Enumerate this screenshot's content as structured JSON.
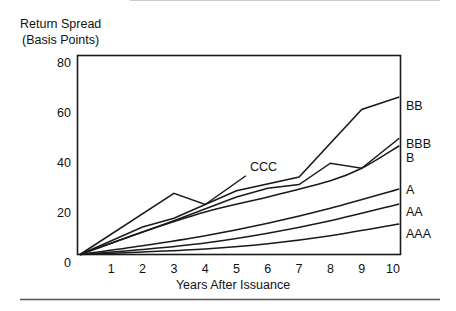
{
  "chart_data": {
    "type": "line",
    "title": "",
    "ylabel": [
      "Return Spread",
      "(Basis Points)"
    ],
    "xlabel": "Years After Issuance",
    "xlim": [
      0,
      10.2
    ],
    "ylim": [
      3,
      83
    ],
    "yticks": [
      0,
      20,
      40,
      60,
      80
    ],
    "xticks": [
      1,
      2,
      3,
      4,
      5,
      6,
      7,
      8,
      9,
      10
    ],
    "grid": false,
    "legend_position": "right-inline-labels",
    "series": [
      {
        "name": "BB",
        "label_y": 105,
        "smooth": false,
        "points": [
          [
            0,
            3
          ],
          [
            2,
            14
          ],
          [
            3,
            17.5
          ],
          [
            5,
            28.5
          ],
          [
            7,
            34
          ],
          [
            9,
            61
          ],
          [
            10.2,
            66
          ]
        ]
      },
      {
        "name": "BBB",
        "label_y": 143,
        "smooth": false,
        "points": [
          [
            0,
            3
          ],
          [
            3,
            16.5
          ],
          [
            5,
            26
          ],
          [
            6,
            29.5
          ],
          [
            7,
            31
          ],
          [
            8,
            39.5
          ],
          [
            9,
            37.5
          ],
          [
            10.2,
            49.5
          ]
        ]
      },
      {
        "name": "B",
        "label_y": 157,
        "smooth": true,
        "points": [
          [
            0,
            3
          ],
          [
            2,
            12
          ],
          [
            4,
            20
          ],
          [
            6,
            26
          ],
          [
            8,
            32.5
          ],
          [
            9,
            37.5
          ],
          [
            10.2,
            46.5
          ]
        ]
      },
      {
        "name": "A",
        "label_y": 189,
        "smooth": true,
        "points": [
          [
            0,
            3
          ],
          [
            2,
            6.5
          ],
          [
            4,
            10.5
          ],
          [
            6,
            15.5
          ],
          [
            8,
            21.5
          ],
          [
            10.2,
            29.2
          ]
        ]
      },
      {
        "name": "AA",
        "label_y": 211,
        "smooth": true,
        "points": [
          [
            0,
            3
          ],
          [
            2,
            5
          ],
          [
            4,
            7.6
          ],
          [
            6,
            11.5
          ],
          [
            8,
            16.5
          ],
          [
            10.2,
            23.2
          ]
        ]
      },
      {
        "name": "AAA",
        "label_y": 233,
        "smooth": true,
        "points": [
          [
            0,
            3
          ],
          [
            2,
            4
          ],
          [
            4,
            5.2
          ],
          [
            6,
            7.3
          ],
          [
            8,
            10.5
          ],
          [
            10.2,
            15.2
          ]
        ]
      },
      {
        "name": "CCC",
        "label_x": 250,
        "label_y": 166,
        "smooth": false,
        "points": [
          [
            0,
            3
          ],
          [
            3,
            27.5
          ],
          [
            4,
            23
          ],
          [
            5.3,
            34.5
          ]
        ]
      }
    ]
  },
  "colors": {
    "line": "#1a1a1a",
    "background": "#ffffff",
    "rule": "#555555"
  }
}
